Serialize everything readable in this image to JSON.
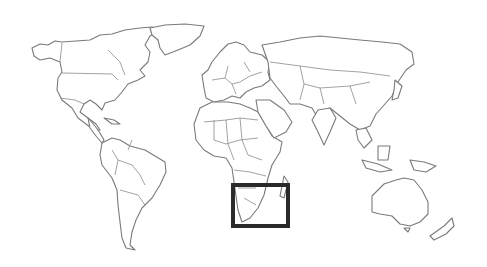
{
  "map": {
    "type": "world-locator-map",
    "style": "outline",
    "colors": {
      "background": "#ffffff",
      "land_outline": "#7a7a7a",
      "highlight_box": "#2a2a2a"
    },
    "highlight": {
      "region": "southern-africa",
      "box": {
        "x": 233,
        "y": 185,
        "width": 55,
        "height": 41,
        "stroke_width": 4
      }
    },
    "continents": [
      "north-america",
      "greenland",
      "south-america",
      "europe",
      "africa",
      "asia",
      "australia",
      "new-zealand"
    ]
  }
}
